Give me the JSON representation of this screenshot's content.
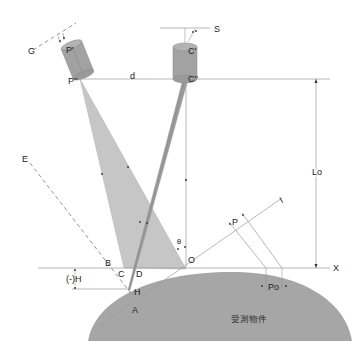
{
  "diagram": {
    "colors": {
      "background": "#ffffff",
      "object_fill": "#a6a6a6",
      "beam_fill": "#c4c4c4",
      "beam_dark_fill": "#9a9a9a",
      "cylinder_fill": "#a0a0a0",
      "line": "#8c8c8c",
      "text": "#222222"
    },
    "labels": {
      "G": "G",
      "P_prime": "P'",
      "P_double_prime": "P''",
      "d": "d",
      "S": "S",
      "C_prime": "C'",
      "C_double_prime": "C''",
      "Lo": "Lo",
      "E": "E",
      "I": "I",
      "P": "P",
      "theta": "θ",
      "O": "O",
      "B": "B",
      "C": "C",
      "D": "D",
      "X": "X",
      "neg_H": "(-)H",
      "H": "H",
      "A": "A",
      "Po": "Po",
      "object": "受測物件"
    }
  }
}
